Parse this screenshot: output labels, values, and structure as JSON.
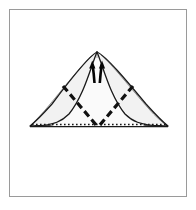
{
  "figure": {
    "title": "Origami fold step diagram",
    "description": "Triangular folded paper form with curved wing edges, mountain/valley fold lines and fold-direction arrows",
    "background_color": "#ffffff",
    "frame": {
      "name": "figure-border",
      "stroke_color": "#9a9a9a",
      "fill_color": "#ffffff",
      "x": 9,
      "y": 9,
      "width": 178,
      "height": 188,
      "stroke_width": 1
    },
    "paper": {
      "outline_color": "#1a1a1a",
      "fill_color": "#f2f2f2",
      "inner_fill_color": "#fafafa",
      "apex": {
        "x": 97,
        "y": 52
      },
      "base_left": {
        "x": 30,
        "y": 126
      },
      "base_right": {
        "x": 168,
        "y": 126
      },
      "base_center": {
        "x": 98,
        "y": 127
      }
    },
    "fold_lines": {
      "left_crease_label": "left mountain fold",
      "right_crease_label": "right mountain fold",
      "crease_color": "#111111",
      "crease_width": 3.2,
      "crease_dash": "7 4",
      "left_start": {
        "x": 63,
        "y": 86
      },
      "left_end": {
        "x": 97,
        "y": 126
      },
      "right_start": {
        "x": 133,
        "y": 86
      },
      "right_end": {
        "x": 99,
        "y": 126
      }
    },
    "base_edge": {
      "label": "hidden base edge",
      "style": "dotted",
      "color": "#151515",
      "dash": "1.6 2.4",
      "width": 1.6
    },
    "arrows": {
      "count": 2,
      "direction": "up",
      "label": "fold upward arrows",
      "color": "#050505",
      "left_arrow": {
        "tip_x": 92,
        "tip_y": 62,
        "tail_x": 94,
        "tail_y": 82
      },
      "right_arrow": {
        "tip_x": 102,
        "tip_y": 62,
        "tail_x": 100,
        "tail_y": 82
      }
    },
    "wings": {
      "left_label": "left wing curve",
      "right_label": "right wing curve",
      "curve_color": "#1a1a1a",
      "curve_width": 1.3
    }
  }
}
